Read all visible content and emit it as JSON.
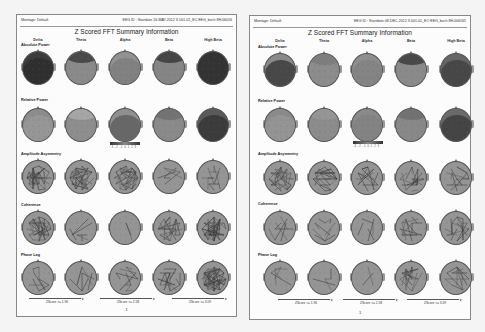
{
  "pages": [
    {
      "montage": "Montage: Default",
      "eeg_id": "EEG ID : Startdate 16-MAY-2012 X.001.01_EC EEG_bsch 8H.06016",
      "title": "Z Scored FFT Summary Information",
      "columns": [
        "Delta",
        "Theta",
        "Alpha",
        "Beta",
        "High Beta"
      ],
      "rows": [
        {
          "label": "Absolute Power",
          "type": "map",
          "fills": [
            "#3c3c3c",
            "#8a8a8a",
            "#929292",
            "#858585",
            "#333333"
          ],
          "accents": [
            "#2a2a2a",
            "#2e2e2e",
            "#7a7a7a",
            "#2a2a2a",
            "#333333"
          ]
        },
        {
          "label": "Relative Power",
          "type": "map",
          "fills": [
            "#8c8c8c",
            "#8e8e8e",
            "#909090",
            "#8a8a8a",
            "#5a5a5a"
          ],
          "accents": [
            "#9a9a9a",
            "#b0b0b0",
            "#555555",
            "#6a6a6a",
            "#2e2e2e"
          ]
        },
        {
          "label": "Amplitude Asymmetry",
          "type": "lines",
          "density": [
            40,
            40,
            38,
            12,
            14
          ]
        },
        {
          "label": "Coherence",
          "type": "lines",
          "density": [
            45,
            6,
            2,
            25,
            50
          ]
        },
        {
          "label": "Phase Lag",
          "type": "lines",
          "density": [
            10,
            8,
            12,
            18,
            60
          ]
        }
      ],
      "colorbar_ticks": "-3 -2 -1 0 1 2 3",
      "zscore_labels": [
        "ZScore >= 1.96",
        "ZScore >= 2.58",
        "ZScore >= 3.09"
      ],
      "page_number": "1"
    },
    {
      "montage": "Montage: Default",
      "eeg_id": "EEG ID : Startdate 08-DEC-2012 X.001.01_EO EEG_bsch 8H.006165",
      "title": "Z Scored FFT Summary Information",
      "columns": [
        "Delta",
        "Theta",
        "Alpha",
        "Beta",
        "High Beta"
      ],
      "rows": [
        {
          "label": "Absolute Power",
          "type": "map",
          "fills": [
            "#8a8a8a",
            "#8c8c8c",
            "#8e8e8e",
            "#8a8a8a",
            "#666666"
          ],
          "accents": [
            "#2c2c2c",
            "#777777",
            "#808080",
            "#2c2c2c",
            "#3a3a3a"
          ]
        },
        {
          "label": "Relative Power",
          "type": "map",
          "fills": [
            "#8a8a8a",
            "#8c8c8c",
            "#8a8a8a",
            "#888888",
            "#6a6a6a"
          ],
          "accents": [
            "#999999",
            "#999999",
            "#808080",
            "#6a6a6a",
            "#353535"
          ]
        },
        {
          "label": "Amplitude Asymmetry",
          "type": "lines",
          "density": [
            35,
            30,
            18,
            20,
            16
          ]
        },
        {
          "label": "Coherence",
          "type": "lines",
          "density": [
            8,
            10,
            5,
            14,
            18
          ]
        },
        {
          "label": "Phase Lag",
          "type": "lines",
          "density": [
            6,
            6,
            3,
            18,
            14
          ]
        }
      ],
      "colorbar_ticks": "-3 -2 -1 0 1 2 3",
      "zscore_labels": [
        "ZScore >= 1.96",
        "ZScore >= 2.58",
        "ZScore >= 3.09"
      ],
      "page_number": "1"
    }
  ]
}
